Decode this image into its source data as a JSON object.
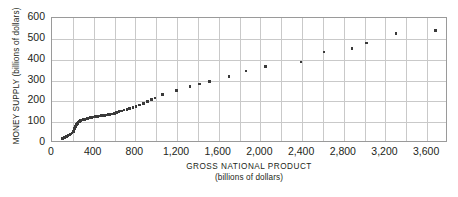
{
  "chart_data": {
    "type": "scatter",
    "title": "",
    "xlabel": "GROSS NATIONAL PRODUCT",
    "xlabel_sub": "(billions of dollars)",
    "ylabel": "MONEY SUPPLY (billions of dollars)",
    "xlim": [
      0,
      3800
    ],
    "ylim": [
      0,
      600
    ],
    "xticks": [
      0,
      400,
      800,
      1200,
      1600,
      2000,
      2400,
      2800,
      3200,
      3600
    ],
    "xtick_labels": [
      "0",
      "400",
      "800",
      "1,200",
      "1,600",
      "2,000",
      "2,400",
      "2,800",
      "3,200",
      "3,600"
    ],
    "yticks": [
      0,
      100,
      200,
      300,
      400,
      500,
      600
    ],
    "ytick_labels": [
      "0",
      "100",
      "200",
      "300",
      "400",
      "500",
      "600"
    ],
    "xgrid_step": 200,
    "ygrid_step": 100,
    "grid": true,
    "legend": false,
    "marker": "square",
    "marker_color": "#3a3a3a",
    "grid_color": "#c9c9c9",
    "frame_color": "#9a9a9a",
    "background": "#ffffff",
    "points": [
      [
        100,
        22
      ],
      [
        110,
        24
      ],
      [
        118,
        26
      ],
      [
        126,
        28
      ],
      [
        134,
        30
      ],
      [
        142,
        32
      ],
      [
        152,
        35
      ],
      [
        163,
        38
      ],
      [
        172,
        41
      ],
      [
        182,
        44
      ],
      [
        192,
        48
      ],
      [
        200,
        52
      ],
      [
        206,
        56
      ],
      [
        212,
        62
      ],
      [
        218,
        70
      ],
      [
        226,
        80
      ],
      [
        234,
        88
      ],
      [
        242,
        95
      ],
      [
        252,
        100
      ],
      [
        264,
        104
      ],
      [
        276,
        108
      ],
      [
        288,
        110
      ],
      [
        300,
        112
      ],
      [
        314,
        114
      ],
      [
        328,
        116
      ],
      [
        342,
        118
      ],
      [
        356,
        120
      ],
      [
        370,
        122
      ],
      [
        384,
        123
      ],
      [
        398,
        124
      ],
      [
        412,
        126
      ],
      [
        426,
        127
      ],
      [
        440,
        128
      ],
      [
        456,
        130
      ],
      [
        472,
        131
      ],
      [
        488,
        132
      ],
      [
        504,
        133
      ],
      [
        520,
        135
      ],
      [
        538,
        136
      ],
      [
        556,
        138
      ],
      [
        576,
        140
      ],
      [
        598,
        143
      ],
      [
        620,
        146
      ],
      [
        644,
        150
      ],
      [
        668,
        154
      ],
      [
        692,
        158
      ],
      [
        718,
        162
      ],
      [
        746,
        166
      ],
      [
        776,
        170
      ],
      [
        808,
        175
      ],
      [
        842,
        182
      ],
      [
        878,
        190
      ],
      [
        916,
        198
      ],
      [
        954,
        208
      ],
      [
        990,
        216
      ],
      [
        1058,
        232
      ],
      [
        1192,
        252
      ],
      [
        1326,
        270
      ],
      [
        1414,
        284
      ],
      [
        1514,
        296
      ],
      [
        1700,
        320
      ],
      [
        1862,
        345
      ],
      [
        2050,
        368
      ],
      [
        2390,
        388
      ],
      [
        2610,
        436
      ],
      [
        2880,
        454
      ],
      [
        3020,
        480
      ],
      [
        3300,
        526
      ],
      [
        3680,
        540
      ]
    ]
  }
}
